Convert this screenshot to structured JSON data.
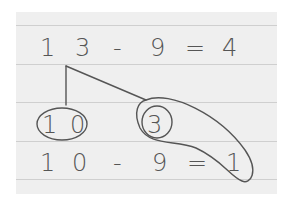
{
  "diagram": {
    "type": "handwritten-math-decomposition",
    "equation_top": {
      "tokens": [
        "1",
        "3",
        "-",
        "9",
        "=",
        "4"
      ],
      "text": "13 - 9 = 4"
    },
    "split": {
      "from": "13",
      "parts": [
        {
          "value": "10",
          "label": [
            "1",
            "0"
          ],
          "circled": true
        },
        {
          "value": "3",
          "label": "3",
          "circled": true,
          "double_circled": true
        }
      ]
    },
    "equation_bottom": {
      "tokens": [
        "1",
        "0",
        "-",
        "9",
        "=",
        "1"
      ],
      "text": "10 - 9 = 1"
    },
    "annotation": "Loop connects circled 3 with result 1 (3 + 1 = 4)",
    "colors": {
      "paper": "#efefef",
      "rule_lines": "#cfcfcf",
      "ink": "#555555",
      "background": "#ffffff"
    }
  }
}
